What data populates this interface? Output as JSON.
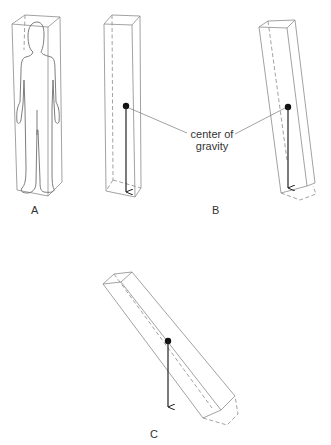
{
  "figure": {
    "panels": [
      {
        "id": "A",
        "label": "A",
        "description": "Human figure standing inside an upright rectangular prism"
      },
      {
        "id": "B",
        "label": "B",
        "description": "Upright prism and slightly tilted prism, both with center of gravity above base"
      },
      {
        "id": "C",
        "label": "C",
        "description": "Strongly tilted prism with center of gravity outside base"
      }
    ],
    "annotation": {
      "line1": "center of",
      "line2": "gravity"
    },
    "colors": {
      "edge": "#8a8a8a",
      "arrow": "#222222",
      "background": "#ffffff"
    }
  }
}
